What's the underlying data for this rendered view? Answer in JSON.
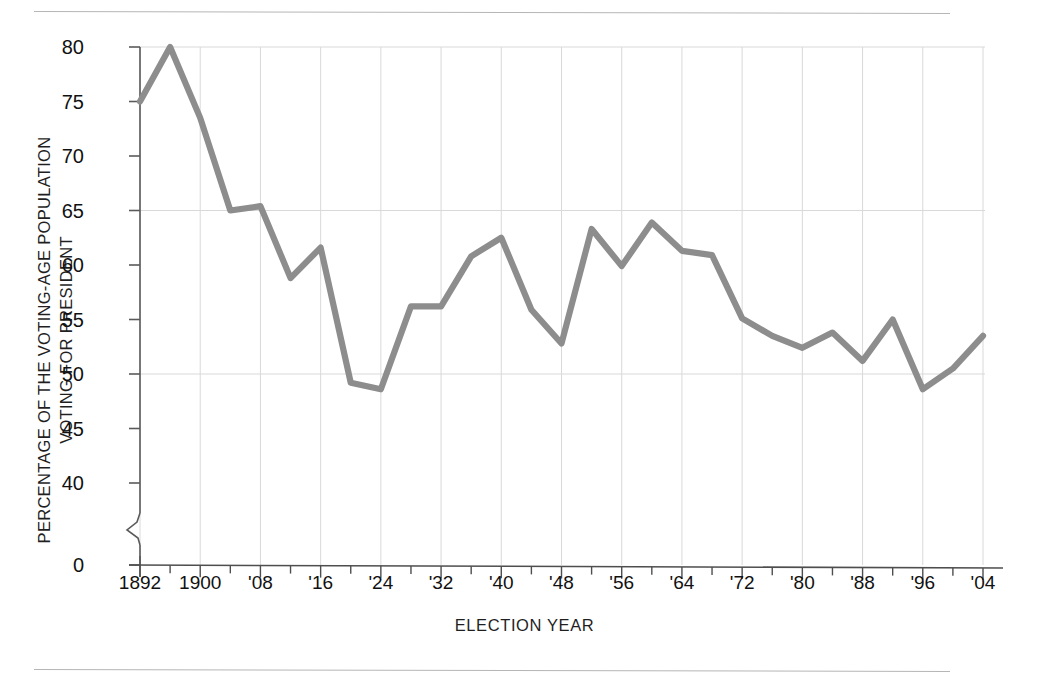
{
  "figure": {
    "background": "#ffffff",
    "line_color": "#8d8d8d",
    "grid_color": "#d9d9d9",
    "axis_color": "#5a5a5a",
    "rule_color": "#b6b6b6"
  },
  "axis_titles": {
    "y_line1": "PERCENTAGE OF THE VOTING-AGE POPULATION",
    "y_line2": "VOTING FOR PRESIDENT",
    "x": "ELECTION YEAR"
  },
  "chart_data": {
    "type": "line",
    "title": "",
    "subtitle": "",
    "xlabel": "ELECTION YEAR",
    "ylabel": "PERCENTAGE OF THE VOTING-AGE POPULATION VOTING FOR PRESIDENT",
    "grid": true,
    "legend": "none",
    "axis_break": true,
    "axis_break_note": "y-axis broken between 0 and 40",
    "ylim": [
      40,
      80
    ],
    "ytick_labels": [
      "80",
      "75",
      "70",
      "65",
      "60",
      "55",
      "50",
      "45",
      "40",
      "0"
    ],
    "yticks": [
      80,
      75,
      70,
      65,
      60,
      55,
      50,
      45,
      40,
      0
    ],
    "gridlines_y": [
      80,
      65,
      50
    ],
    "xlim": [
      1892,
      2004
    ],
    "xtick_labels": [
      "1892",
      "1900",
      "'08",
      "'16",
      "'24",
      "'32",
      "'40",
      "'48",
      "'56",
      "'64",
      "'72",
      "'80",
      "'88",
      "'96",
      "'04"
    ],
    "xticks_major": [
      1892,
      1900,
      1908,
      1916,
      1924,
      1932,
      1940,
      1948,
      1956,
      1964,
      1972,
      1980,
      1988,
      1996,
      2004
    ],
    "minor_tick_interval_years": 4,
    "x": [
      1892,
      1896,
      1900,
      1904,
      1908,
      1912,
      1916,
      1920,
      1924,
      1928,
      1932,
      1936,
      1940,
      1944,
      1948,
      1952,
      1956,
      1960,
      1964,
      1968,
      1972,
      1976,
      1980,
      1984,
      1988,
      1992,
      1996,
      2000,
      2004
    ],
    "values": [
      75.0,
      80.0,
      73.5,
      65.0,
      65.4,
      58.8,
      61.6,
      49.2,
      48.6,
      56.2,
      56.2,
      60.8,
      62.5,
      55.9,
      52.8,
      63.3,
      59.9,
      63.9,
      61.3,
      60.9,
      55.1,
      53.5,
      52.4,
      53.8,
      51.2,
      55.0,
      48.6,
      50.5,
      53.5
    ]
  }
}
